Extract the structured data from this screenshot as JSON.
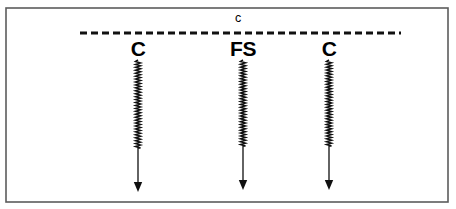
{
  "figure": {
    "name": "spring-suspension-diagram",
    "background_color": "#ffffff",
    "frame_color": "#5c5c5c",
    "ink_color": "#101010",
    "width": 456,
    "height": 209
  },
  "ceiling": {
    "label": "c",
    "line_style": "dashed",
    "y": 33,
    "x_start": 80,
    "x_end": 401,
    "label_x": 238,
    "label_y": 22
  },
  "elements": [
    {
      "label": "C",
      "name": "spring-damper-left",
      "x": 138,
      "label_y": 56,
      "spring_top": 60,
      "spring_bottom": 148,
      "arrow_tip": 192,
      "coil_count": 30,
      "coil_width": 5
    },
    {
      "label": "FS",
      "name": "spring-force-source-middle",
      "x": 243,
      "label_y": 56,
      "spring_top": 60,
      "spring_bottom": 146,
      "arrow_tip": 190,
      "coil_count": 30,
      "coil_width": 5
    },
    {
      "label": "C",
      "name": "spring-damper-right",
      "x": 329,
      "label_y": 56,
      "spring_top": 60,
      "spring_bottom": 146,
      "arrow_tip": 190,
      "coil_count": 30,
      "coil_width": 5
    }
  ]
}
